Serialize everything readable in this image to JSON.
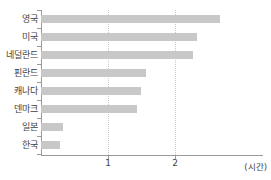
{
  "chart_data": {
    "type": "bar",
    "orientation": "horizontal",
    "title": "",
    "xlabel": "(시간)",
    "ylabel": "",
    "categories": [
      "영국",
      "미국",
      "네덜란드",
      "핀란드",
      "캐나다",
      "덴마크",
      "일본",
      "한국"
    ],
    "values": [
      2.67,
      2.33,
      2.27,
      1.57,
      1.49,
      1.43,
      0.33,
      0.28
    ],
    "xticks": [
      "1",
      "2"
    ],
    "xtick_values": [
      1,
      2
    ],
    "xlim": [
      0,
      3.0
    ],
    "grid": "vertical-dotted",
    "legend": "none",
    "bar_color": "#c8c8c8",
    "axis_color": "#9a9a9a",
    "grid_color": "#c9c9c9"
  },
  "unit_label": "(시간)"
}
